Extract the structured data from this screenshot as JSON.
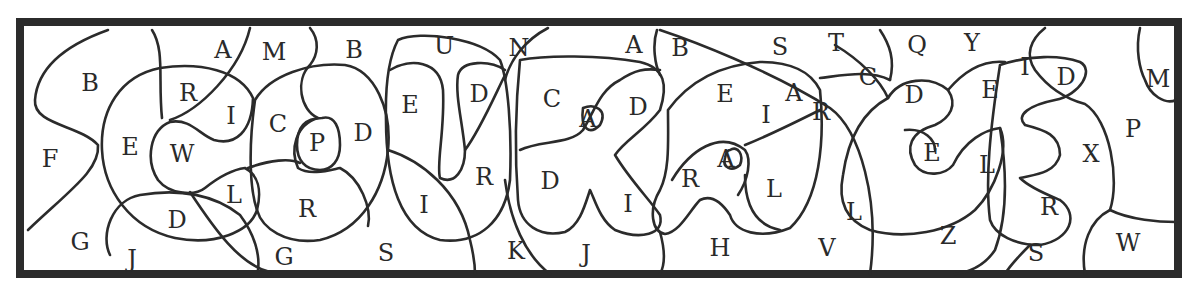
{
  "puzzle": {
    "type": "hidden-word letter-region puzzle",
    "frame": {
      "x": 20,
      "y": 22,
      "width": 1158,
      "height": 252,
      "color": "#2b2b2b"
    },
    "letters": [
      {
        "ch": "A",
        "x": 223,
        "y": 50
      },
      {
        "ch": "M",
        "x": 274,
        "y": 52
      },
      {
        "ch": "B",
        "x": 354,
        "y": 50
      },
      {
        "ch": "B",
        "x": 90,
        "y": 83
      },
      {
        "ch": "R",
        "x": 188,
        "y": 93
      },
      {
        "ch": "I",
        "x": 231,
        "y": 116
      },
      {
        "ch": "C",
        "x": 278,
        "y": 124
      },
      {
        "ch": "E",
        "x": 130,
        "y": 147
      },
      {
        "ch": "W",
        "x": 182,
        "y": 154
      },
      {
        "ch": "P",
        "x": 317,
        "y": 143
      },
      {
        "ch": "D",
        "x": 363,
        "y": 133
      },
      {
        "ch": "F",
        "x": 50,
        "y": 159
      },
      {
        "ch": "L",
        "x": 234,
        "y": 195
      },
      {
        "ch": "D",
        "x": 177,
        "y": 220
      },
      {
        "ch": "R",
        "x": 307,
        "y": 209
      },
      {
        "ch": "G",
        "x": 80,
        "y": 242
      },
      {
        "ch": "J",
        "x": 132,
        "y": 259
      },
      {
        "ch": "G",
        "x": 284,
        "y": 257
      },
      {
        "ch": "S",
        "x": 386,
        "y": 253
      },
      {
        "ch": "U",
        "x": 444,
        "y": 46
      },
      {
        "ch": "N",
        "x": 519,
        "y": 48
      },
      {
        "ch": "E",
        "x": 410,
        "y": 105
      },
      {
        "ch": "D",
        "x": 479,
        "y": 94
      },
      {
        "ch": "R",
        "x": 484,
        "y": 177
      },
      {
        "ch": "I",
        "x": 424,
        "y": 205
      },
      {
        "ch": "K",
        "x": 516,
        "y": 251
      },
      {
        "ch": "A",
        "x": 634,
        "y": 45
      },
      {
        "ch": "B",
        "x": 680,
        "y": 48
      },
      {
        "ch": "C",
        "x": 552,
        "y": 99
      },
      {
        "ch": "A",
        "x": 588,
        "y": 119
      },
      {
        "ch": "D",
        "x": 638,
        "y": 107
      },
      {
        "ch": "D",
        "x": 550,
        "y": 181
      },
      {
        "ch": "I",
        "x": 628,
        "y": 204
      },
      {
        "ch": "J",
        "x": 586,
        "y": 254
      },
      {
        "ch": "S",
        "x": 780,
        "y": 47
      },
      {
        "ch": "E",
        "x": 725,
        "y": 94
      },
      {
        "ch": "A",
        "x": 794,
        "y": 93
      },
      {
        "ch": "I",
        "x": 766,
        "y": 115
      },
      {
        "ch": "R",
        "x": 690,
        "y": 179
      },
      {
        "ch": "A",
        "x": 726,
        "y": 159
      },
      {
        "ch": "L",
        "x": 774,
        "y": 189
      },
      {
        "ch": "H",
        "x": 720,
        "y": 248
      },
      {
        "ch": "T",
        "x": 836,
        "y": 43
      },
      {
        "ch": "Q",
        "x": 917,
        "y": 45
      },
      {
        "ch": "Y",
        "x": 972,
        "y": 43
      },
      {
        "ch": "C",
        "x": 868,
        "y": 77
      },
      {
        "ch": "D",
        "x": 914,
        "y": 95
      },
      {
        "ch": "R",
        "x": 821,
        "y": 112
      },
      {
        "ch": "E",
        "x": 932,
        "y": 153
      },
      {
        "ch": "L",
        "x": 854,
        "y": 212
      },
      {
        "ch": "V",
        "x": 827,
        "y": 248
      },
      {
        "ch": "I",
        "x": 1025,
        "y": 67
      },
      {
        "ch": "D",
        "x": 1066,
        "y": 77
      },
      {
        "ch": "E",
        "x": 990,
        "y": 90
      },
      {
        "ch": "L",
        "x": 987,
        "y": 165
      },
      {
        "ch": "X",
        "x": 1091,
        "y": 154
      },
      {
        "ch": "P",
        "x": 1133,
        "y": 129
      },
      {
        "ch": "M",
        "x": 1158,
        "y": 79
      },
      {
        "ch": "Z",
        "x": 948,
        "y": 236
      },
      {
        "ch": "R",
        "x": 1049,
        "y": 207
      },
      {
        "ch": "S",
        "x": 1036,
        "y": 253
      },
      {
        "ch": "W",
        "x": 1128,
        "y": 243
      }
    ]
  }
}
